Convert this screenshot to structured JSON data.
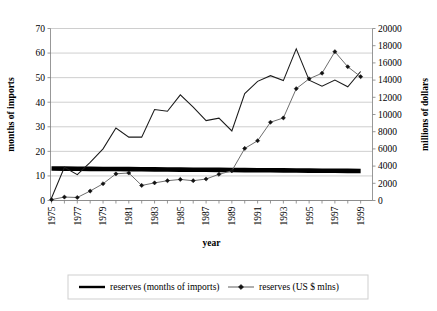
{
  "chart_data": {
    "type": "line",
    "title": "",
    "xlabel": "year",
    "ylabel": "months of imports",
    "y2label": "millions of dollars",
    "grid": true,
    "legend_position": "bottom",
    "xlim": [
      1975,
      2000
    ],
    "ylim": [
      0,
      70
    ],
    "y2lim": [
      0,
      20000
    ],
    "x_tick_labels": [
      "1975",
      "1977",
      "1979",
      "1981",
      "1983",
      "1985",
      "1987",
      "1989",
      "1991",
      "1993",
      "1995",
      "1997",
      "1999"
    ],
    "y_tick_labels": [
      "0",
      "10",
      "20",
      "30",
      "40",
      "50",
      "60",
      "70"
    ],
    "y2_tick_labels": [
      "0",
      "2000",
      "4000",
      "6000",
      "8000",
      "10000",
      "12000",
      "14000",
      "16000",
      "18000",
      "20000"
    ],
    "x": [
      1975,
      1976,
      1977,
      1978,
      1979,
      1980,
      1981,
      1982,
      1983,
      1984,
      1985,
      1986,
      1987,
      1988,
      1989,
      1990,
      1991,
      1992,
      1993,
      1994,
      1995,
      1996,
      1997,
      1998,
      1999
    ],
    "series": [
      {
        "name": "reserves (months of imports) trend",
        "axis": "left",
        "style": "thick-line",
        "marker": "none",
        "color": "#000000",
        "values": [
          13.0,
          12.96,
          12.92,
          12.88,
          12.83,
          12.79,
          12.75,
          12.71,
          12.67,
          12.63,
          12.58,
          12.54,
          12.5,
          12.46,
          12.42,
          12.38,
          12.33,
          12.29,
          12.25,
          12.21,
          12.17,
          12.13,
          12.08,
          12.04,
          12.0
        ]
      },
      {
        "name": "months of imports (annual)",
        "axis": "left",
        "style": "thin-line",
        "marker": "none",
        "color": "#1a1a1a",
        "values": [
          1.0,
          13.5,
          10.5,
          15.5,
          21.0,
          29.5,
          25.8,
          25.8,
          37.0,
          36.3,
          43.0,
          38.0,
          32.5,
          33.5,
          28.3,
          43.5,
          48.5,
          50.8,
          48.8,
          61.7,
          49.0,
          46.5,
          49.0,
          46.3,
          52.5
        ]
      },
      {
        "name": "reserves (US $ mlns)",
        "axis": "right",
        "style": "marker-line",
        "marker": "diamond",
        "color": "#6e6e6e",
        "values": [
          100,
          400,
          350,
          1100,
          1950,
          3100,
          3200,
          1750,
          2050,
          2300,
          2450,
          2300,
          2500,
          3050,
          3450,
          6050,
          6950,
          9100,
          9600,
          13000,
          14150,
          14800,
          17300,
          15550,
          14400
        ]
      }
    ],
    "legend": [
      {
        "label": "reserves (months of imports)",
        "style": "thick-line",
        "marker": "none",
        "color": "#000000"
      },
      {
        "label": "reserves (US $ mlns)",
        "style": "marker-line",
        "marker": "diamond",
        "color": "#6e6e6e"
      }
    ]
  }
}
